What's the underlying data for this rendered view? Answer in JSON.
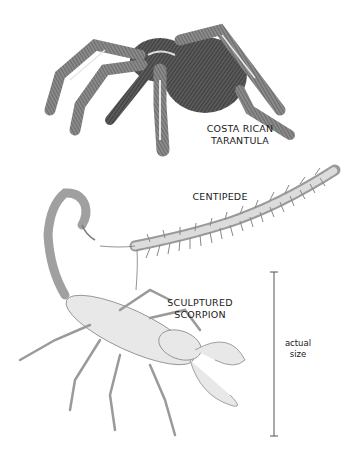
{
  "specimens": [
    {
      "id": "tarantula",
      "label_line1": "COSTA RICAN",
      "label_line2": "TARANTULA"
    },
    {
      "id": "centipede",
      "label_line1": "CENTIPEDE"
    },
    {
      "id": "scorpion",
      "label_line1": "SCULPTURED",
      "label_line2": "SCORPION"
    }
  ],
  "scale_bar": {
    "label_line1": "actual",
    "label_line2": "size"
  },
  "colors": {
    "ink": "#1a1a1a",
    "tarantula_dark": "#3a3a3a",
    "scorpion_fill": "#e8e8e8",
    "centipede_fill": "#d9d9d9"
  }
}
